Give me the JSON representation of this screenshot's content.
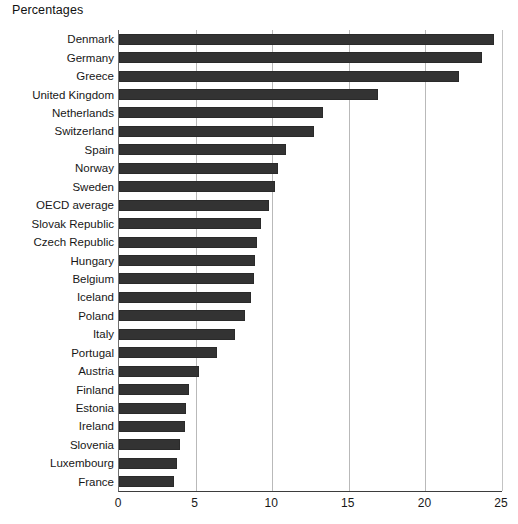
{
  "chart_data": {
    "type": "bar",
    "orientation": "horizontal",
    "title": "Percentages",
    "xlabel": "",
    "ylabel": "",
    "xlim": [
      0,
      25
    ],
    "xticks": [
      0,
      5,
      10,
      15,
      20,
      25
    ],
    "xtick_labels": [
      "0",
      "5",
      "10",
      "15",
      "20",
      "25"
    ],
    "grid": true,
    "legend": false,
    "bar_color": "#333333",
    "categories": [
      "Denmark",
      "Germany",
      "Greece",
      "United Kingdom",
      "Netherlands",
      "Switzerland",
      "Spain",
      "Norway",
      "Sweden",
      "OECD average",
      "Slovak Republic",
      "Czech Republic",
      "Hungary",
      "Belgium",
      "Iceland",
      "Poland",
      "Italy",
      "Portugal",
      "Austria",
      "Finland",
      "Estonia",
      "Ireland",
      "Slovenia",
      "Luxembourg",
      "France"
    ],
    "values": [
      24.5,
      23.7,
      22.2,
      16.9,
      13.3,
      12.7,
      10.9,
      10.4,
      10.2,
      9.8,
      9.3,
      9.0,
      8.9,
      8.8,
      8.6,
      8.2,
      7.6,
      6.4,
      5.2,
      4.6,
      4.4,
      4.3,
      4.0,
      3.8,
      3.6
    ]
  }
}
